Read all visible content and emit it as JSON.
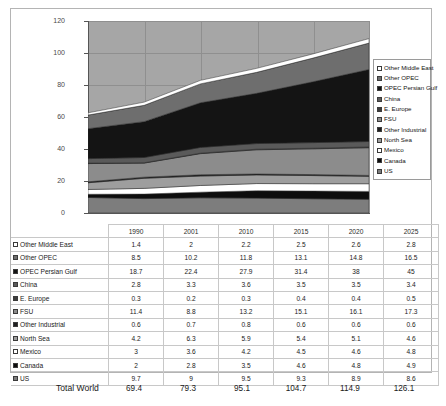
{
  "chart_data": {
    "type": "area",
    "title": "",
    "subtitle": "",
    "xlabel": "",
    "ylabel": "",
    "categories": [
      "1990",
      "2001",
      "2010",
      "2015",
      "2020",
      "2025"
    ],
    "ylim": [
      0,
      120
    ],
    "yticks": [
      "0",
      "20",
      "40",
      "60",
      "80",
      "100",
      "120"
    ],
    "grid": true,
    "stacked": true,
    "legend_position": "right",
    "stack_order_bottom_to_top": [
      "US",
      "Canada",
      "Mexico",
      "North Sea",
      "Other Industrial",
      "FSU",
      "E. Europe",
      "China",
      "OPEC Persian Gulf",
      "Other OPEC",
      "Other Middle East"
    ],
    "series": [
      {
        "name": "Other Middle East",
        "color": "#ffffff",
        "values": [
          1.4,
          2,
          2.2,
          2.5,
          2.6,
          2.8
        ]
      },
      {
        "name": "Other OPEC",
        "color": "#6e6e6e",
        "values": [
          8.5,
          10.2,
          11.8,
          13.1,
          14.8,
          16.5
        ]
      },
      {
        "name": "OPEC Persian Gulf",
        "color": "#141414",
        "values": [
          18.7,
          22.4,
          27.9,
          31.4,
          38,
          45
        ]
      },
      {
        "name": "China",
        "color": "#5a5a5a",
        "values": [
          2.8,
          3.3,
          3.6,
          3.5,
          3.5,
          3.4
        ]
      },
      {
        "name": "E. Europe",
        "color": "#3c3c3c",
        "values": [
          0.3,
          0.2,
          0.3,
          0.4,
          0.4,
          0.5
        ]
      },
      {
        "name": "FSU",
        "color": "#8c8c8c",
        "values": [
          11.4,
          8.8,
          13.2,
          15.1,
          16.1,
          17.3
        ]
      },
      {
        "name": "Other Industrial",
        "color": "#1f1f1f",
        "values": [
          0.6,
          0.7,
          0.8,
          0.6,
          0.6,
          0.6
        ]
      },
      {
        "name": "North Sea",
        "color": "#9e9e9e",
        "values": [
          4.2,
          6.3,
          5.9,
          5.4,
          5.1,
          4.6
        ]
      },
      {
        "name": "Mexico",
        "color": "#ffffff",
        "values": [
          3,
          3.6,
          4.2,
          4.5,
          4.6,
          4.8
        ]
      },
      {
        "name": "Canada",
        "color": "#0d0d0d",
        "values": [
          2,
          2.8,
          3.5,
          4.6,
          4.8,
          4.9
        ]
      },
      {
        "name": "US",
        "color": "#7d7d7d",
        "values": [
          9.7,
          9,
          9.5,
          9.3,
          8.9,
          8.6
        ]
      }
    ]
  },
  "legend": {
    "items": [
      {
        "label": "Other Middle East",
        "color": "#ffffff"
      },
      {
        "label": "Other OPEC",
        "color": "#6e6e6e"
      },
      {
        "label": "OPEC Persian Gulf",
        "color": "#141414"
      },
      {
        "label": "China",
        "color": "#5a5a5a"
      },
      {
        "label": "E. Europe",
        "color": "#3c3c3c"
      },
      {
        "label": "FSU",
        "color": "#8c8c8c"
      },
      {
        "label": "Other Industrial",
        "color": "#1f1f1f"
      },
      {
        "label": "North Sea",
        "color": "#9e9e9e"
      },
      {
        "label": "Mexico",
        "color": "#ffffff"
      },
      {
        "label": "Canada",
        "color": "#0d0d0d"
      },
      {
        "label": "US",
        "color": "#7d7d7d"
      }
    ]
  },
  "table": {
    "corner_label": "",
    "columns": [
      "1990",
      "2001",
      "2010",
      "2015",
      "2020",
      "2025"
    ],
    "rows": [
      {
        "label": "Other Middle East",
        "color": "#ffffff",
        "values": [
          "1.4",
          "2",
          "2.2",
          "2.5",
          "2.6",
          "2.8"
        ]
      },
      {
        "label": "Other OPEC",
        "color": "#6e6e6e",
        "values": [
          "8.5",
          "10.2",
          "11.8",
          "13.1",
          "14.8",
          "16.5"
        ]
      },
      {
        "label": "OPEC Persian Gulf",
        "color": "#141414",
        "values": [
          "18.7",
          "22.4",
          "27.9",
          "31.4",
          "38",
          "45"
        ]
      },
      {
        "label": "China",
        "color": "#5a5a5a",
        "values": [
          "2.8",
          "3.3",
          "3.6",
          "3.5",
          "3.5",
          "3.4"
        ]
      },
      {
        "label": "E. Europe",
        "color": "#3c3c3c",
        "values": [
          "0.3",
          "0.2",
          "0.3",
          "0.4",
          "0.4",
          "0.5"
        ]
      },
      {
        "label": "FSU",
        "color": "#8c8c8c",
        "values": [
          "11.4",
          "8.8",
          "13.2",
          "15.1",
          "16.1",
          "17.3"
        ]
      },
      {
        "label": "Other Industrial",
        "color": "#1f1f1f",
        "values": [
          "0.6",
          "0.7",
          "0.8",
          "0.6",
          "0.6",
          "0.6"
        ]
      },
      {
        "label": "North Sea",
        "color": "#9e9e9e",
        "values": [
          "4.2",
          "6.3",
          "5.9",
          "5.4",
          "5.1",
          "4.6"
        ]
      },
      {
        "label": "Mexico",
        "color": "#ffffff",
        "values": [
          "3",
          "3.6",
          "4.2",
          "4.5",
          "4.6",
          "4.8"
        ]
      },
      {
        "label": "Canada",
        "color": "#0d0d0d",
        "values": [
          "2",
          "2.8",
          "3.5",
          "4.6",
          "4.8",
          "4.9"
        ]
      },
      {
        "label": "US",
        "color": "#7d7d7d",
        "values": [
          "9.7",
          "9",
          "9.5",
          "9.3",
          "8.9",
          "8.6"
        ]
      }
    ]
  },
  "total": {
    "label": "Total World",
    "values": [
      "69.4",
      "79.3",
      "95.1",
      "104.7",
      "114.9",
      "126.1"
    ]
  }
}
